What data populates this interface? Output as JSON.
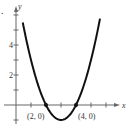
{
  "marker": ".",
  "chart_data": {
    "type": "line",
    "title": "",
    "xlabel": "x",
    "ylabel": "y",
    "xlim": [
      -0.2,
      7.2
    ],
    "ylim": [
      -1.4,
      6.4
    ],
    "grid": false,
    "function": "y = (x - 2)(x - 4) = x^2 - 6x + 8",
    "x_ticks": [
      1,
      2,
      3,
      4,
      5,
      6
    ],
    "y_ticks": [
      -1,
      1,
      2,
      3,
      4,
      5,
      6
    ],
    "y_tick_labels": [
      {
        "value": 2,
        "label": "2"
      },
      {
        "value": 4,
        "label": "4"
      }
    ],
    "series": [
      {
        "name": "parabola",
        "x": [
          0.45,
          1,
          1.5,
          2,
          2.5,
          3,
          3.5,
          4,
          4.5,
          5,
          5.6
        ],
        "y": [
          5.5,
          3,
          1.25,
          0,
          -0.75,
          -1,
          -0.75,
          0,
          1.25,
          3,
          5.76
        ]
      }
    ],
    "points": [
      {
        "x": 2,
        "y": 0,
        "label": "(2, 0)"
      },
      {
        "x": 4,
        "y": 0,
        "label": "(4, 0)"
      }
    ],
    "annotations": [
      "(2, 0)",
      "(4, 0)"
    ],
    "colors": {
      "curve": "#111111",
      "axis": "#555555",
      "text": "#333333"
    }
  }
}
